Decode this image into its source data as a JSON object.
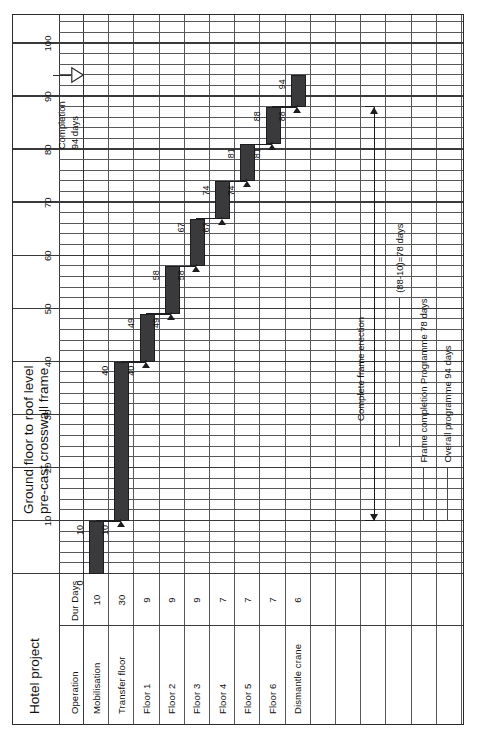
{
  "document": {
    "project_title": "Hotel project",
    "heading_line_1": "Ground floor to roof level",
    "heading_line_2": "pre-cast crosswall frame"
  },
  "table": {
    "col_operation": "Operation",
    "col_duration": "Dur Days"
  },
  "chart_data": {
    "type": "bar",
    "subtitle": "Hotel project",
    "xlabel": "",
    "ylabel": "Operation",
    "xlim": [
      0,
      105
    ],
    "grid": true,
    "legend": "none",
    "axis_ticks": [
      "10",
      "20",
      "30",
      "40",
      "50",
      "60",
      "70",
      "80",
      "90",
      "100"
    ],
    "axis_tick_values": [
      10,
      20,
      30,
      40,
      50,
      60,
      70,
      80,
      90,
      100
    ],
    "categories": [
      "Mobilisation",
      "Transfer floor",
      "Floor 1",
      "Floor 2",
      "Floor 3",
      "Floor 4",
      "Floor 5",
      "Floor 6",
      "Dismantle crane"
    ],
    "durations": [
      10,
      30,
      9,
      9,
      9,
      7,
      7,
      7,
      6
    ],
    "duration_labels": [
      "10",
      "30",
      "9",
      "9",
      "9",
      "7",
      "7",
      "7",
      "6"
    ],
    "starts": [
      0,
      10,
      40,
      49,
      58,
      67,
      74,
      81,
      88
    ],
    "finishes": [
      10,
      40,
      49,
      58,
      67,
      74,
      81,
      88,
      94
    ],
    "start_labels": [
      "0",
      "10",
      "40",
      "49",
      "58",
      "67",
      "74",
      "81",
      "88"
    ],
    "finish_labels": [
      "10",
      "40",
      "49",
      "58",
      "67",
      "74",
      "81",
      "88",
      "94"
    ],
    "bars": [
      {
        "task": "Mobilisation",
        "dur": "10",
        "start": 0,
        "finish": 10,
        "start_label": "0",
        "finish_label": "10"
      },
      {
        "task": "Transfer floor",
        "dur": "30",
        "start": 10,
        "finish": 40,
        "start_label": "10",
        "finish_label": "40"
      },
      {
        "task": "Floor 1",
        "dur": "9",
        "start": 40,
        "finish": 49,
        "start_label": "40",
        "finish_label": "49"
      },
      {
        "task": "Floor 2",
        "dur": "9",
        "start": 49,
        "finish": 58,
        "start_label": "49",
        "finish_label": "58"
      },
      {
        "task": "Floor 3",
        "dur": "9",
        "start": 58,
        "finish": 67,
        "start_label": "58",
        "finish_label": "67"
      },
      {
        "task": "Floor 4",
        "dur": "7",
        "start": 67,
        "finish": 74,
        "start_label": "67",
        "finish_label": "74"
      },
      {
        "task": "Floor 5",
        "dur": "7",
        "start": 74,
        "finish": 81,
        "start_label": "74",
        "finish_label": "81"
      },
      {
        "task": "Floor 6",
        "dur": "7",
        "start": 81,
        "finish": 88,
        "start_label": "81",
        "finish_label": "88"
      },
      {
        "task": "Dismantle crane",
        "dur": "6",
        "start": 88,
        "finish": 94,
        "start_label": "88",
        "finish_label": "94"
      }
    ],
    "annotations": [
      {
        "id": "completion",
        "line_1": "Completion",
        "line_2": "94 days",
        "at": 94
      },
      {
        "id": "frame-erection",
        "text": "Complete frame erection"
      },
      {
        "id": "frame-days",
        "text": "(88-10)=78 days"
      },
      {
        "id": "frame-programme",
        "text": "Frame completion Programme 78 days"
      },
      {
        "id": "overall-programme",
        "text": "Overall programme 94 days"
      }
    ]
  },
  "colors": {
    "bar_fill": "#3a3a3c",
    "grid": "#58585a",
    "frame": "#2b2b2b",
    "text": "#111111"
  }
}
